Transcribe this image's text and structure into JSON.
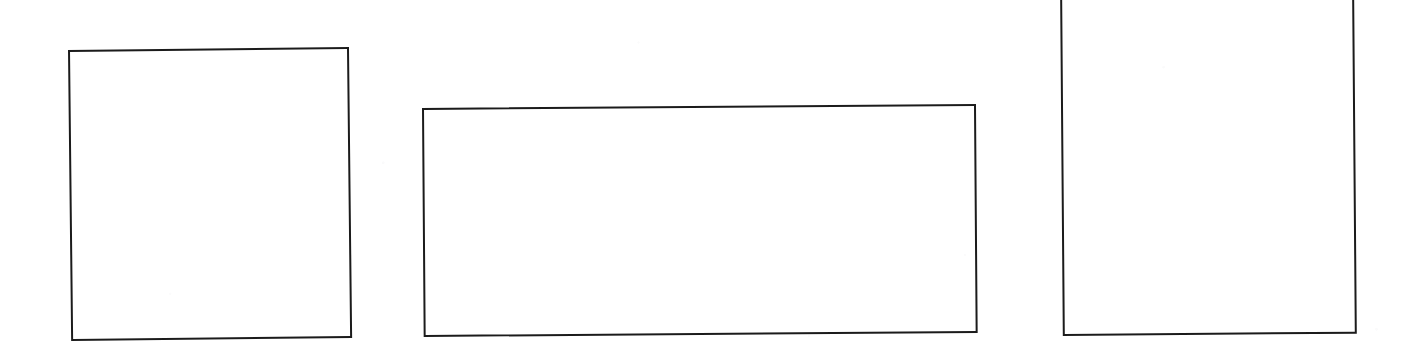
{
  "page": {
    "background_color": "#ffffff",
    "ink_color": "#1b1b1b",
    "width": 1419,
    "height": 354,
    "text_content": ""
  },
  "shapes": [
    {
      "name": "rectangle-left",
      "order_label": "1",
      "kind": "rectangle-outline",
      "fill": "none",
      "stroke_color": "#1b1b1b",
      "stroke_width_px": 2,
      "x": 68,
      "y": 50,
      "width": 281,
      "height": 291,
      "rotation_deg": -0.62,
      "clipped_by_frame": false,
      "label": ""
    },
    {
      "name": "rectangle-middle",
      "order_label": "2",
      "kind": "rectangle-outline",
      "fill": "none",
      "stroke_color": "#1b1b1b",
      "stroke_width_px": 2,
      "x": 422,
      "y": 108,
      "width": 554,
      "height": 229,
      "rotation_deg": -0.42,
      "clipped_by_frame": false,
      "label": ""
    },
    {
      "name": "rectangle-right",
      "order_label": "3",
      "kind": "rectangle-outline",
      "fill": "none",
      "stroke_color": "#1b1b1b",
      "stroke_width_px": 2,
      "x": 1060,
      "y": -22,
      "width": 294,
      "height": 358,
      "rotation_deg": -0.45,
      "clipped_by_frame": true,
      "clipped_edge": "top",
      "label": ""
    }
  ]
}
